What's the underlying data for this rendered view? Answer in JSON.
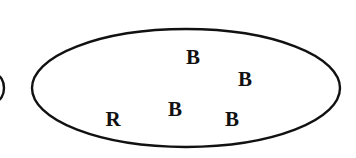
{
  "figure": {
    "name": "urn-with-balls-diagram",
    "type": "set-diagram",
    "width": 356,
    "height": 158,
    "background_color": "#ffffff",
    "stroke_color": "#111111"
  },
  "container": {
    "shape": "ellipse",
    "label": "urn",
    "cx": 186,
    "cy": 88,
    "rx": 154,
    "ry": 59,
    "stroke_width": 2.4,
    "stroke_color": "#111111",
    "fill": "none"
  },
  "partial_shape": {
    "shape": "arc",
    "label": "clipped-neighbor-circle",
    "cx": -4,
    "cy": 88,
    "rx": 8,
    "ry": 13,
    "stroke_width": 2.4,
    "stroke_color": "#111111"
  },
  "items": [
    {
      "label": "B",
      "x": 193,
      "y": 57,
      "font_size": 21,
      "color": "#111111"
    },
    {
      "label": "B",
      "x": 245,
      "y": 79,
      "font_size": 21,
      "color": "#111111"
    },
    {
      "label": "B",
      "x": 175,
      "y": 109,
      "font_size": 21,
      "color": "#111111"
    },
    {
      "label": "R",
      "x": 113,
      "y": 119,
      "font_size": 21,
      "color": "#111111"
    },
    {
      "label": "B",
      "x": 232,
      "y": 119,
      "font_size": 21,
      "color": "#111111"
    }
  ],
  "legend": {
    "B_meaning": "B",
    "R_meaning": "R",
    "counts": {
      "B": 4,
      "R": 1,
      "total": 5
    }
  }
}
